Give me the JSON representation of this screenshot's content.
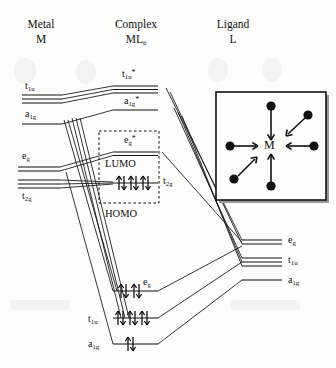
{
  "diagram": {
    "columns": [
      {
        "id": "metal",
        "header_line1": "Metal",
        "header_line2_base": "M",
        "header_line2_sub": "",
        "header_line2_sup": ""
      },
      {
        "id": "complex",
        "header_line1": "Complex",
        "header_line2_base": "ML",
        "header_line2_sub": "6",
        "header_line2_sup": ""
      },
      {
        "id": "ligand",
        "header_line1": "Ligand",
        "header_line2_base": "L",
        "header_line2_sub": "",
        "header_line2_sup": ""
      }
    ],
    "metal_levels": [
      {
        "base": "t",
        "sub": "1u",
        "sup": "",
        "lines": 3,
        "electrons": 0
      },
      {
        "base": "a",
        "sub": "1g",
        "sup": "",
        "lines": 1,
        "electrons": 0
      },
      {
        "base": "e",
        "sub": "g",
        "sup": "",
        "lines": 2,
        "electrons": 0
      },
      {
        "base": "t",
        "sub": "2g",
        "sup": "",
        "lines": 3,
        "electrons": 0
      }
    ],
    "complex_levels": [
      {
        "base": "t",
        "sub": "1u",
        "sup": "*",
        "lines": 3,
        "electrons": 0,
        "kind": "antibonding"
      },
      {
        "base": "a",
        "sub": "1g",
        "sup": "*",
        "lines": 1,
        "electrons": 0,
        "kind": "antibonding"
      },
      {
        "base": "e",
        "sub": "g",
        "sup": "*",
        "lines": 2,
        "electrons": 0,
        "kind": "antibonding"
      },
      {
        "base": "t",
        "sub": "2g",
        "sup": "",
        "lines": 1,
        "electrons": 6,
        "kind": "nonbonding"
      },
      {
        "base": "e",
        "sub": "g",
        "sup": "",
        "lines": 1,
        "electrons": 4,
        "kind": "bonding"
      },
      {
        "base": "t",
        "sub": "1u",
        "sup": "",
        "lines": 1,
        "electrons": 6,
        "kind": "bonding"
      },
      {
        "base": "a",
        "sub": "1g",
        "sup": "",
        "lines": 1,
        "electrons": 2,
        "kind": "bonding"
      }
    ],
    "ligand_levels": [
      {
        "base": "e",
        "sub": "g",
        "sup": "",
        "lines": 2,
        "electrons": 0
      },
      {
        "base": "t",
        "sub": "1u",
        "sup": "",
        "lines": 3,
        "electrons": 0
      },
      {
        "base": "a",
        "sub": "1g",
        "sup": "",
        "lines": 1,
        "electrons": 0
      }
    ],
    "frontier_labels": {
      "lumo": "LUMO",
      "homo": "HOMO"
    },
    "inset": {
      "center_label": "M",
      "ligand_count": 6,
      "arrow_direction": "inward"
    },
    "colors": {
      "ink": "#111111",
      "background": "#fdfdfb",
      "inset_shadow": "#9a9a96"
    }
  }
}
